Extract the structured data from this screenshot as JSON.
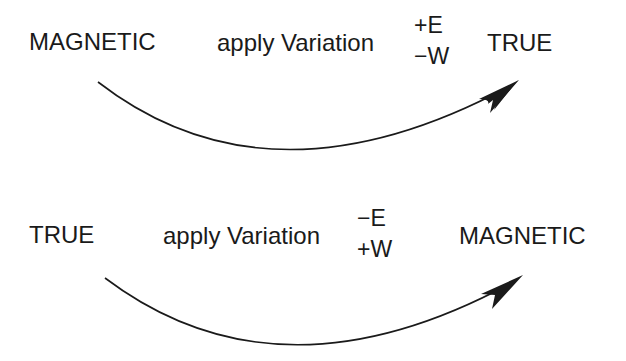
{
  "diagrams": [
    {
      "from": "MAGNETIC",
      "action": "apply Variation",
      "sign_top": "+E",
      "sign_bottom": "−W",
      "to": "TRUE"
    },
    {
      "from": "TRUE",
      "action": "apply Variation",
      "sign_top": "−E",
      "sign_bottom": "+W",
      "to": "MAGNETIC"
    }
  ],
  "colors": {
    "ink": "#1a1a1a",
    "background": "#ffffff"
  }
}
